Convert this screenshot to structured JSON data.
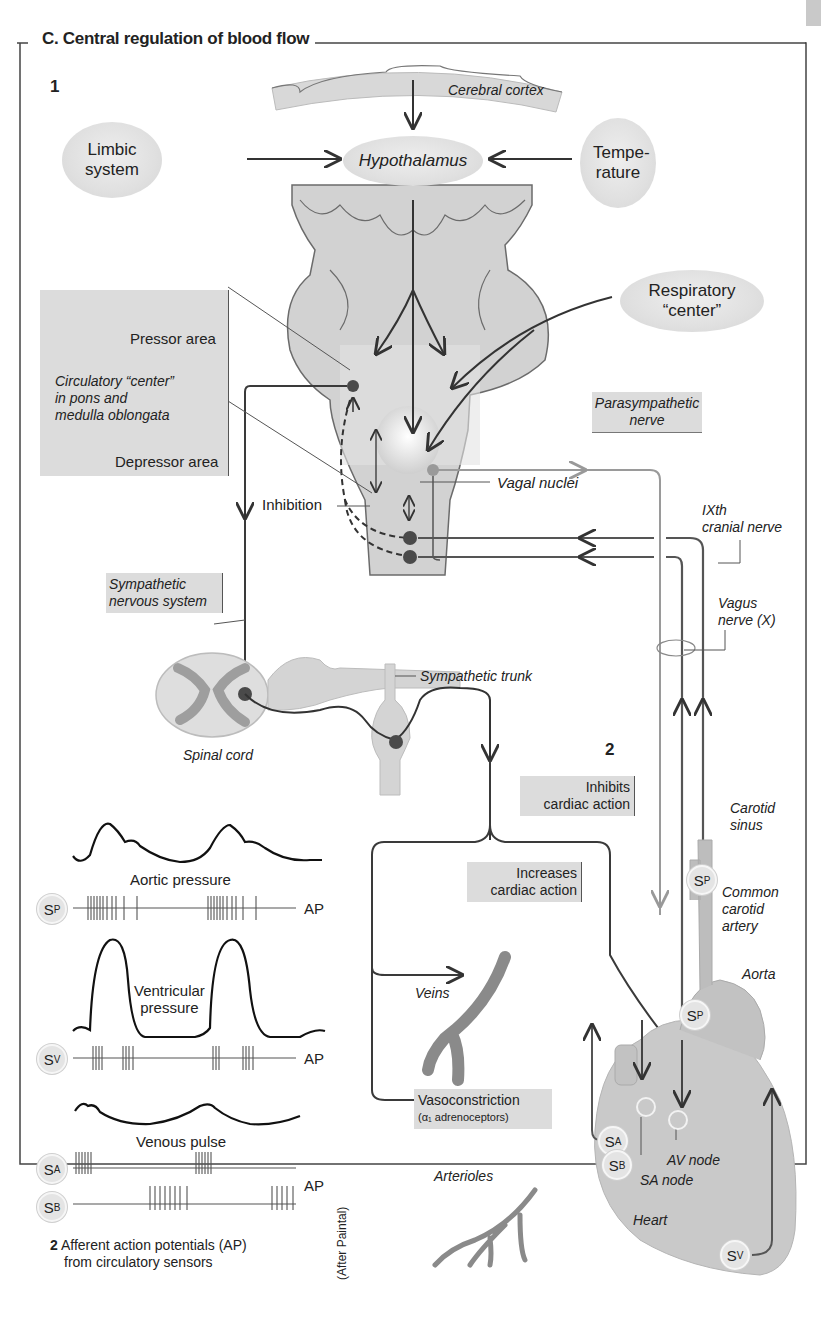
{
  "figure": {
    "title": "C. Central regulation of blood flow",
    "panel_1_number": "1",
    "panel_2_number": "2",
    "credit": "(After Paintal)"
  },
  "brain": {
    "cerebral_cortex": "Cerebral cortex",
    "limbic_system": "Limbic system",
    "hypothalamus": "Hypothalamus",
    "temperature": "Tempe-rature",
    "respiratory_center": "Respiratory “center”"
  },
  "circulatory_center_box": {
    "pressor_area": "Pressor area",
    "description_line1": "Circulatory “center”",
    "description_line2": "in pons and",
    "description_line3": "medulla oblongata",
    "depressor_area": "Depressor area"
  },
  "medulla": {
    "inhibition": "Inhibition",
    "vagal_nuclei": "Vagal nuclei",
    "parasympathetic_line1": "Parasympathetic",
    "parasympathetic_line2": "nerve",
    "ixth_line1": "IXth",
    "ixth_line2": "cranial nerve",
    "vagus_line1": "Vagus",
    "vagus_line2": "nerve (X)"
  },
  "sympathetic": {
    "label_line1": "Sympathetic",
    "label_line2": "nervous system",
    "spinal_cord": "Spinal cord",
    "sympathetic_trunk": "Sympathetic trunk"
  },
  "effectors": {
    "inhibits_line1": "Inhibits",
    "inhibits_line2": "cardiac action",
    "increases_line1": "Increases",
    "increases_line2": "cardiac action",
    "veins": "Veins",
    "vasoconstriction": "Vasoconstriction",
    "vasoconstriction_sub": "(α₁ adrenoceptors)",
    "arterioles": "Arterioles"
  },
  "heart": {
    "carotid_sinus_line1": "Carotid",
    "carotid_sinus_line2": "sinus",
    "common_carotid_line1": "Common",
    "common_carotid_line2": "carotid",
    "common_carotid_line3": "artery",
    "aorta": "Aorta",
    "av_node": "AV node",
    "sa_node": "SA node",
    "heart": "Heart",
    "sensors": {
      "sp": {
        "base": "S",
        "sub": "P"
      },
      "sa": {
        "base": "S",
        "sub": "A"
      },
      "sb": {
        "base": "S",
        "sub": "B"
      },
      "sv": {
        "base": "S",
        "sub": "V"
      }
    }
  },
  "ap_panel": {
    "aortic_pressure": "Aortic pressure",
    "ventricular_line1": "Ventricular",
    "ventricular_line2": "pressure",
    "venous_pulse": "Venous pulse",
    "ap": "AP",
    "caption_number": "2",
    "caption_line1": "Afferent action potentials (AP)",
    "caption_line2": "from circulatory sensors",
    "sensors": {
      "sp": {
        "base": "S",
        "sub": "P"
      },
      "sv": {
        "base": "S",
        "sub": "V"
      },
      "sa": {
        "base": "S",
        "sub": "A"
      },
      "sb": {
        "base": "S",
        "sub": "B"
      }
    }
  },
  "colors": {
    "gray_fill": "#dcdcdc",
    "tissue": "#d2d2d2",
    "line_dark": "#3a3a3a",
    "line_light": "#a0a0a0",
    "neuron_dot": "#4a4a4a"
  }
}
